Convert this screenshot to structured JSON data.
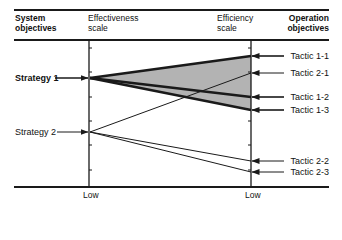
{
  "header": {
    "system_objectives": [
      "System",
      "objectives"
    ],
    "effectiveness_scale": [
      "Effectiveness",
      "scale"
    ],
    "efficiency_scale": [
      "Efficiency",
      "scale"
    ],
    "operation_objectives": [
      "Operation",
      "objectives"
    ]
  },
  "strategies": [
    {
      "label": "Strategy 1",
      "bold": true
    },
    {
      "label": "Strategy 2",
      "bold": false
    }
  ],
  "tactics": [
    {
      "label": "Tactic 1-1",
      "strategy": 1,
      "emphasis": true
    },
    {
      "label": "Tactic 2-1",
      "strategy": 2,
      "emphasis": false
    },
    {
      "label": "Tactic 1-2",
      "strategy": 1,
      "emphasis": true
    },
    {
      "label": "Tactic 1-3",
      "strategy": 1,
      "emphasis": true
    },
    {
      "label": "Tactic 2-2",
      "strategy": 2,
      "emphasis": false
    },
    {
      "label": "Tactic 2-3",
      "strategy": 2,
      "emphasis": false
    }
  ],
  "axes": {
    "left_low": "Low",
    "right_low": "Low"
  },
  "colors": {
    "ink": "#1a1a1a",
    "fan_fill": "#b3b3b3",
    "background": "#ffffff"
  }
}
